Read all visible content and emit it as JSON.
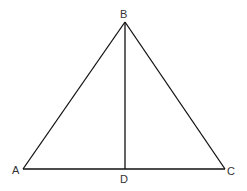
{
  "diagram": {
    "type": "geometry-triangle",
    "points": {
      "A": {
        "label": "A",
        "x": 23,
        "y": 169
      },
      "B": {
        "label": "B",
        "x": 125,
        "y": 22
      },
      "C": {
        "label": "C",
        "x": 225,
        "y": 169
      },
      "D": {
        "label": "D",
        "x": 125,
        "y": 169
      }
    },
    "segments": [
      "AB",
      "BC",
      "AC",
      "BD"
    ],
    "stroke_color": "#111111"
  }
}
